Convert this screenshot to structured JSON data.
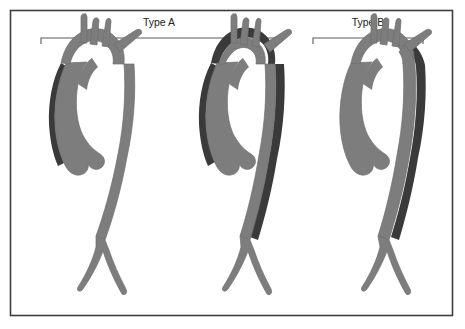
{
  "figure": {
    "frame": {
      "border_color": "#3c3c46",
      "background_color": "#ffffff",
      "x": 10,
      "y": 10,
      "width": 443,
      "height": 306
    },
    "colors": {
      "vessel_fill": "#7d7d7d",
      "vessel_outline": "#6e6e6e",
      "dissection_flap": "#3a3a3a",
      "lumen": "#ffffff",
      "bracket": "#5a5a5a",
      "label": "#222222"
    },
    "groups": [
      {
        "id": "type-a",
        "label": "Type A",
        "label_x": 159,
        "label_y": 26,
        "bracket": {
          "x1": 41,
          "x2": 277,
          "y": 38,
          "tick": 6
        },
        "description": "Dissection involves the ascending aorta",
        "panel_ids": [
          "panel-1",
          "panel-2"
        ]
      },
      {
        "id": "type-b",
        "label": "Type B",
        "label_x": 368,
        "label_y": 26,
        "bracket": {
          "x1": 313,
          "x2": 423,
          "y": 38,
          "tick": 6
        },
        "description": "Dissection confined to descending aorta distal to left subclavian artery",
        "panel_ids": [
          "panel-3"
        ]
      }
    ],
    "panels": [
      {
        "id": "panel-1",
        "group": "type-a",
        "index": 1,
        "origin_x": 30,
        "flap_extent": "ascending-aorta-only",
        "branches": [
          "brachiocephalic-artery",
          "left-common-carotid-artery",
          "left-subclavian-artery"
        ],
        "features": [
          "aortic-root-sinuses",
          "aortic-arch",
          "descending-aorta",
          "iliac-bifurcation"
        ]
      },
      {
        "id": "panel-2",
        "group": "type-a",
        "index": 2,
        "origin_x": 180,
        "flap_extent": "ascending-arch-and-descending-aorta",
        "branches": [
          "brachiocephalic-artery",
          "left-common-carotid-artery",
          "left-subclavian-artery"
        ],
        "features": [
          "aortic-root-sinuses",
          "aortic-arch",
          "descending-aorta",
          "iliac-bifurcation"
        ]
      },
      {
        "id": "panel-3",
        "group": "type-b",
        "index": 3,
        "origin_x": 320,
        "flap_extent": "descending-aorta-distal-to-left-subclavian",
        "branches": [
          "brachiocephalic-artery",
          "left-common-carotid-artery",
          "left-subclavian-artery"
        ],
        "features": [
          "aortic-root-sinuses",
          "aortic-arch",
          "descending-aorta",
          "iliac-bifurcation"
        ]
      }
    ]
  }
}
